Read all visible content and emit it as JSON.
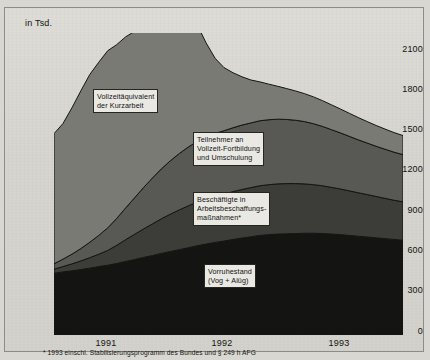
{
  "figure": {
    "unit_label": "in Tsd.",
    "footnote": "* 1993 einschl. Stabilisierungsprogramm des Bundes und § 249 h AFG"
  },
  "axes": {
    "y_ticks": [
      "2100",
      "1800",
      "1500",
      "1200",
      "900",
      "600",
      "300",
      "0"
    ],
    "x_ticks": [
      "1991",
      "1992",
      "1993"
    ]
  },
  "series_labels": {
    "kurzarbeit": "Vollzeitäquivalent\nder Kurzarbeit",
    "fortbildung": "Teilnehmer an\nVollzeit-Fortbildung\nund Umschulung",
    "abm": "Beschäftigte in\nArbeitsbeschaffungs-\nmaßnahmen*",
    "vorruhestand": "Vorruhestand\n(Vog + Alüg)"
  },
  "colors": {
    "band_kurzarbeit": "#7a7a75",
    "band_fortbildung": "#585854",
    "band_abm": "#3c3c39",
    "band_vorruhestand": "#141413",
    "background": "#d8d7d2",
    "outline": "#15150f"
  },
  "chart_data": {
    "type": "area",
    "stacked": true,
    "title": "",
    "xlabel": "",
    "ylabel": "in Tsd.",
    "ylim": [
      0,
      2250
    ],
    "grid": false,
    "legend_position": "inline-annotations",
    "x": [
      "1990-07",
      "1990-08",
      "1990-09",
      "1990-10",
      "1990-11",
      "1990-12",
      "1991-01",
      "1991-02",
      "1991-03",
      "1991-04",
      "1991-05",
      "1991-06",
      "1991-07",
      "1991-08",
      "1991-09",
      "1991-10",
      "1991-11",
      "1991-12",
      "1992-01",
      "1992-02",
      "1992-03",
      "1992-04",
      "1992-05",
      "1992-06",
      "1992-07",
      "1992-08",
      "1992-09",
      "1992-10",
      "1992-11",
      "1992-12",
      "1993-01",
      "1993-02",
      "1993-03",
      "1993-04",
      "1993-05",
      "1993-06",
      "1993-07",
      "1993-08",
      "1993-09",
      "1993-10"
    ],
    "series": [
      {
        "name": "Vorruhestand (Vog + Alüg)",
        "color": "#141413",
        "values": [
          460,
          470,
          478,
          488,
          498,
          510,
          520,
          533,
          548,
          562,
          578,
          592,
          608,
          622,
          636,
          650,
          665,
          678,
          690,
          700,
          712,
          722,
          732,
          742,
          748,
          752,
          754,
          756,
          758,
          758,
          756,
          752,
          748,
          742,
          736,
          730,
          724,
          718,
          712,
          706
        ]
      },
      {
        "name": "Beschäftigte in Arbeitsbeschaffungsmaßnahmen*",
        "color": "#3c3c39",
        "values": [
          30,
          40,
          52,
          64,
          78,
          92,
          110,
          135,
          162,
          188,
          212,
          236,
          258,
          278,
          296,
          312,
          325,
          336,
          344,
          350,
          356,
          362,
          366,
          370,
          372,
          374,
          374,
          372,
          368,
          362,
          356,
          348,
          340,
          332,
          324,
          316,
          308,
          300,
          292,
          286
        ]
      },
      {
        "name": "Teilnehmer an Vollzeit-Fortbildung und Umschulung",
        "color": "#585854",
        "values": [
          40,
          55,
          72,
          92,
          115,
          140,
          168,
          200,
          236,
          272,
          308,
          342,
          372,
          398,
          420,
          438,
          452,
          462,
          468,
          472,
          476,
          480,
          482,
          484,
          484,
          482,
          478,
          472,
          464,
          454,
          442,
          430,
          418,
          406,
          394,
          384,
          374,
          366,
          358,
          352
        ]
      },
      {
        "name": "Vollzeitäquivalent der Kurzarbeit",
        "color": "#7a7a75",
        "values": [
          970,
          1010,
          1090,
          1175,
          1250,
          1290,
          1320,
          1295,
          1275,
          1240,
          1255,
          1265,
          1280,
          1230,
          1140,
          1020,
          870,
          700,
          560,
          470,
          410,
          360,
          320,
          290,
          265,
          245,
          230,
          218,
          208,
          200,
          192,
          185,
          178,
          172,
          166,
          160,
          155,
          150,
          146,
          142
        ]
      }
    ]
  }
}
